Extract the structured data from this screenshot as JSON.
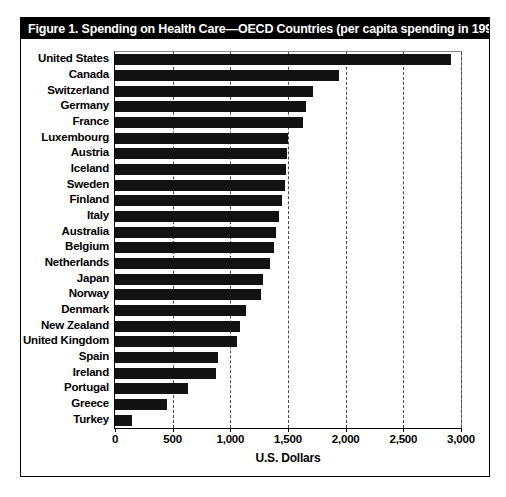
{
  "figure": {
    "title": "Figure 1.  Spending on Health Care—OECD Countries (per capita spending in 1991)",
    "title_superscript": "28",
    "frame_color": "#000000",
    "title_bar_color": "#000000",
    "title_text_color": "#ffffff",
    "bar_color": "#121212",
    "gridline_color": "#4a4a4a"
  },
  "chart_data": {
    "type": "bar",
    "orientation": "horizontal",
    "title": "Figure 1.  Spending on Health Care—OECD Countries (per capita spending in 1991)",
    "xlabel": "U.S. Dollars",
    "ylabel": "",
    "xlim": [
      0,
      3000
    ],
    "xticks": [
      0,
      500,
      1000,
      1500,
      2000,
      2500,
      3000
    ],
    "xtick_labels": [
      "0",
      "500",
      "1,000",
      "1,500",
      "2,000",
      "2,500",
      "3,000"
    ],
    "grid": "vertical-dashed",
    "legend": "none",
    "categories": [
      "United States",
      "Canada",
      "Switzerland",
      "Germany",
      "France",
      "Luxembourg",
      "Austria",
      "Iceland",
      "Sweden",
      "Finland",
      "Italy",
      "Australia",
      "Belgium",
      "Netherlands",
      "Japan",
      "Norway",
      "Denmark",
      "New Zealand",
      "United Kingdom",
      "Spain",
      "Ireland",
      "Portugal",
      "Greece",
      "Turkey"
    ],
    "values": [
      2910,
      1945,
      1720,
      1660,
      1630,
      1500,
      1490,
      1480,
      1470,
      1450,
      1420,
      1400,
      1380,
      1345,
      1280,
      1270,
      1140,
      1080,
      1055,
      890,
      880,
      630,
      450,
      145
    ],
    "units": "U.S. Dollars per capita",
    "year": 1991,
    "source_note": "OECD Countries"
  }
}
